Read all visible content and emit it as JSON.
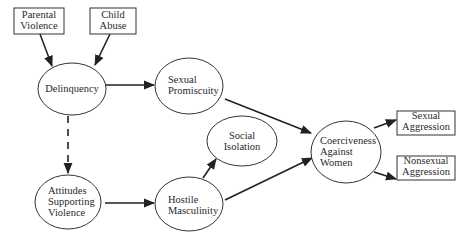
{
  "diagram": {
    "type": "path-diagram",
    "colors": {
      "stroke": "#333333",
      "text": "#2a2a2a",
      "background": "#ffffff"
    },
    "nodes": [
      {
        "id": "parental_violence",
        "shape": "rect",
        "lines": [
          "Parental",
          "Violence"
        ]
      },
      {
        "id": "child_abuse",
        "shape": "rect",
        "lines": [
          "Child",
          "Abuse"
        ]
      },
      {
        "id": "delinquency",
        "shape": "ellipse",
        "lines": [
          "Delinquency"
        ]
      },
      {
        "id": "sexual_promiscuity",
        "shape": "ellipse",
        "lines": [
          "Sexual",
          "Promiscuity"
        ]
      },
      {
        "id": "social_isolation",
        "shape": "ellipse",
        "lines": [
          "Social",
          "Isolation"
        ]
      },
      {
        "id": "attitudes_supporting_violence",
        "shape": "ellipse",
        "lines": [
          "Attitudes",
          "Supporting",
          "Violence"
        ]
      },
      {
        "id": "hostile_masculinity",
        "shape": "ellipse",
        "lines": [
          "Hostile",
          "Masculinity"
        ]
      },
      {
        "id": "coerciveness_against_women",
        "shape": "ellipse",
        "lines": [
          "Coerciveness",
          "Against",
          "Women"
        ]
      },
      {
        "id": "sexual_aggression",
        "shape": "rect",
        "lines": [
          "Sexual",
          "Aggression"
        ]
      },
      {
        "id": "nonsexual_aggression",
        "shape": "rect",
        "lines": [
          "Nonsexual",
          "Aggression"
        ]
      }
    ],
    "edges": [
      {
        "from": "parental_violence",
        "to": "delinquency",
        "style": "solid"
      },
      {
        "from": "child_abuse",
        "to": "delinquency",
        "style": "solid"
      },
      {
        "from": "delinquency",
        "to": "sexual_promiscuity",
        "style": "solid"
      },
      {
        "from": "delinquency",
        "to": "attitudes_supporting_violence",
        "style": "dashed"
      },
      {
        "from": "attitudes_supporting_violence",
        "to": "hostile_masculinity",
        "style": "solid"
      },
      {
        "from": "hostile_masculinity",
        "to": "social_isolation",
        "style": "solid"
      },
      {
        "from": "sexual_promiscuity",
        "to": "coerciveness_against_women",
        "style": "solid"
      },
      {
        "from": "hostile_masculinity",
        "to": "coerciveness_against_women",
        "style": "solid"
      },
      {
        "from": "coerciveness_against_women",
        "to": "sexual_aggression",
        "style": "solid"
      },
      {
        "from": "coerciveness_against_women",
        "to": "nonsexual_aggression",
        "style": "solid"
      }
    ]
  }
}
